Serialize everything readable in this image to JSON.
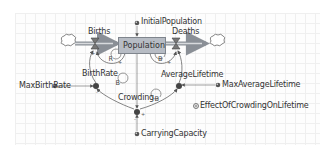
{
  "diagram": {
    "type": "stock-and-flow",
    "stock": {
      "label": "Population"
    },
    "flows": [
      {
        "label": "Births",
        "direction": "inflow"
      },
      {
        "label": "Deaths",
        "direction": "outflow"
      }
    ],
    "variables": {
      "initial_population": "InitialPopulation",
      "birth_rate": "BirthRate",
      "max_birth_rate": "MaxBirthRate",
      "average_lifetime": "AverageLifetime",
      "max_average_lifetime": "MaxAverageLifetime",
      "effect_of_crowding": "EffectOfCrowdingOnLifetime",
      "crowding": "Crowding",
      "carrying_capacity": "CarryingCapacity"
    },
    "loops": [
      {
        "id": "births-loop",
        "type": "R"
      },
      {
        "id": "deaths-loop",
        "type": "B"
      },
      {
        "id": "birthrate-loop",
        "type": "B"
      },
      {
        "id": "crowding-loop",
        "type": "B"
      }
    ],
    "polarities": [
      "+",
      "+",
      "-",
      "+",
      "-",
      "+"
    ],
    "colors": {
      "stock_fill": "#b7bcc4",
      "flow_pipe": "#8a8f96",
      "arrow": "#555555",
      "aux_dot": "#444444"
    }
  }
}
